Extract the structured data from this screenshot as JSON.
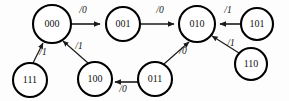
{
  "diagram": {
    "type": "state-transition-diagram",
    "width": 289,
    "height": 101,
    "background_color": "#fdfdfd",
    "stroke_color": "#000000",
    "states": [
      {
        "id": "s000",
        "label": "000",
        "cx": 52,
        "cy": 24,
        "r": 19
      },
      {
        "id": "s001",
        "label": "001",
        "cx": 123,
        "cy": 24,
        "r": 17
      },
      {
        "id": "s010",
        "label": "010",
        "cx": 197,
        "cy": 24,
        "r": 18
      },
      {
        "id": "s101",
        "label": "101",
        "cx": 257,
        "cy": 24,
        "r": 16
      },
      {
        "id": "s111",
        "label": "111",
        "cx": 30,
        "cy": 80,
        "r": 17
      },
      {
        "id": "s100",
        "label": "100",
        "cx": 95,
        "cy": 79,
        "r": 17
      },
      {
        "id": "s011",
        "label": "011",
        "cx": 155,
        "cy": 79,
        "r": 17
      },
      {
        "id": "s110",
        "label": "110",
        "cx": 251,
        "cy": 64,
        "r": 16
      }
    ],
    "transitions": [
      {
        "id": "t1",
        "from": "000",
        "to": "001",
        "label": "/0",
        "label_x": 83,
        "label_y": 11
      },
      {
        "id": "t2",
        "from": "001",
        "to": "010",
        "label": "/0",
        "label_x": 160,
        "label_y": 11
      },
      {
        "id": "t3",
        "from": "101",
        "to": "010",
        "label": "/1",
        "label_x": 228,
        "label_y": 11
      },
      {
        "id": "t4",
        "from": "110",
        "to": "010",
        "label": "/1",
        "label_x": 231,
        "label_y": 44
      },
      {
        "id": "t5",
        "from": "011",
        "to": "010",
        "label": "/0",
        "label_x": 183,
        "label_y": 52
      },
      {
        "id": "t6",
        "from": "011",
        "to": "100",
        "label": "/0",
        "label_x": 123,
        "label_y": 90
      },
      {
        "id": "t7",
        "from": "100",
        "to": "000",
        "label": "/1",
        "label_x": 79,
        "label_y": 47
      },
      {
        "id": "t8",
        "from": "111",
        "to": "000",
        "label": "/1",
        "label_x": 43,
        "label_y": 53
      }
    ]
  }
}
